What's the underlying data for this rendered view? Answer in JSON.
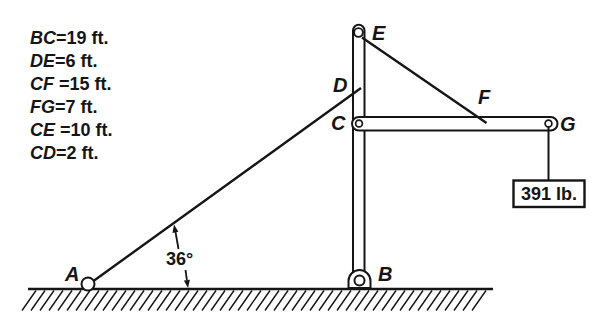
{
  "diagram": {
    "given": [
      {
        "name": "BC",
        "value": "=19 ft."
      },
      {
        "name": "DE",
        "value": "=6 ft."
      },
      {
        "name": "CF",
        "value": " =15 ft."
      },
      {
        "name": "FG",
        "value": "=7 ft."
      },
      {
        "name": "CE",
        "value": " =10 ft."
      },
      {
        "name": "CD",
        "value": "=2 ft."
      }
    ],
    "labels": {
      "A": "A",
      "B": "B",
      "C": "C",
      "D": "D",
      "E": "E",
      "F": "F",
      "G": "G"
    },
    "angle": "36°",
    "load": "391 lb."
  },
  "colors": {
    "ink": "#151515",
    "paper": "#ffffff"
  }
}
